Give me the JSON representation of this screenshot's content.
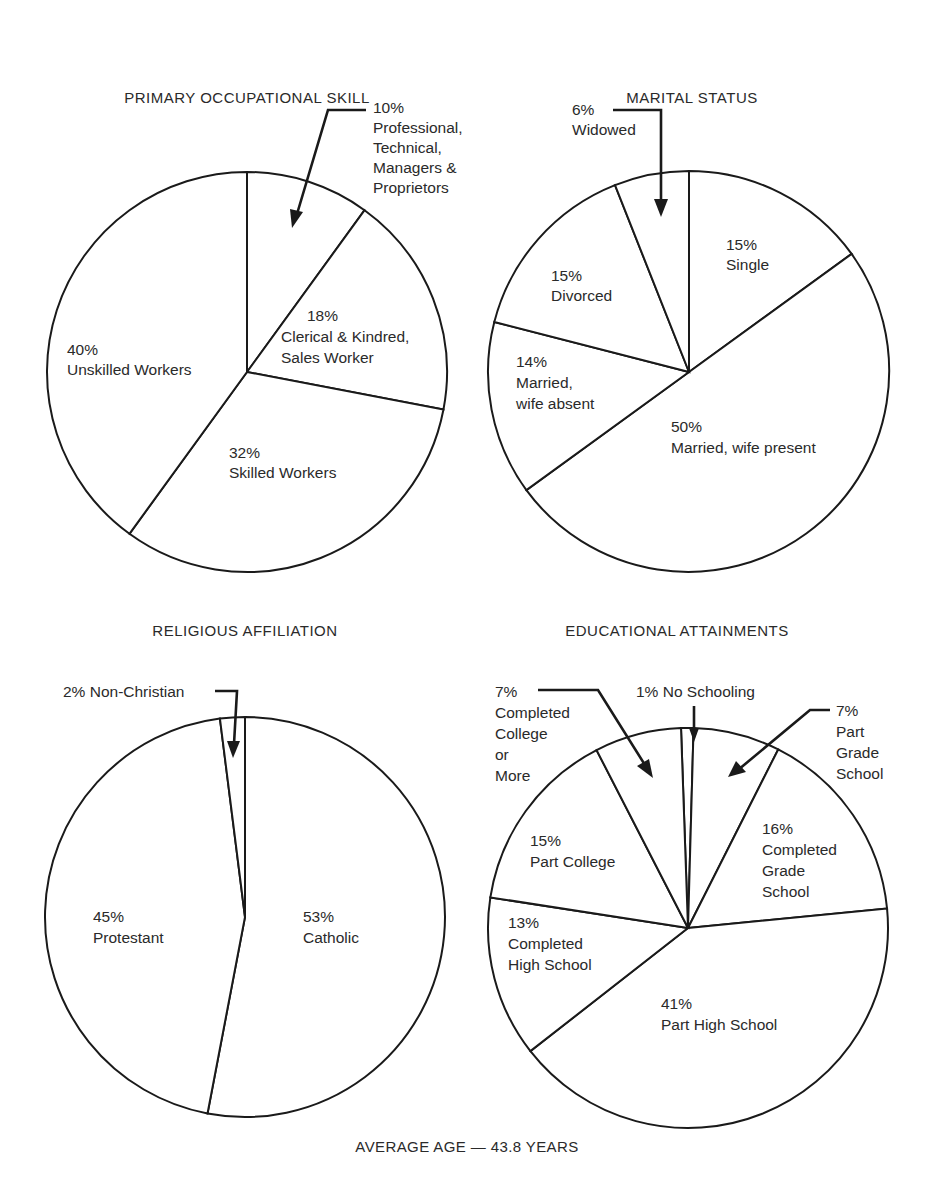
{
  "footer": "AVERAGE AGE — 43.8 YEARS",
  "chart_data": [
    {
      "type": "pie",
      "title": "PRIMARY OCCUPATIONAL SKILL",
      "categories": [
        "Professional, Technical, Managers & Proprietors",
        "Clerical & Kindred, Sales Worker",
        "Skilled Workers",
        "Unskilled Workers"
      ],
      "values": [
        10,
        18,
        32,
        40
      ],
      "unit": "%",
      "start_angle": "12 o'clock",
      "direction": "clockwise"
    },
    {
      "type": "pie",
      "title": "MARITAL STATUS",
      "categories": [
        "Single",
        "Married, wife present",
        "Married, wife absent",
        "Divorced",
        "Widowed"
      ],
      "values": [
        15,
        50,
        14,
        15,
        6
      ],
      "unit": "%",
      "start_angle": "12 o'clock",
      "direction": "clockwise"
    },
    {
      "type": "pie",
      "title": "RELIGIOUS AFFILIATION",
      "categories": [
        "Catholic",
        "Protestant",
        "Non-Christian"
      ],
      "values": [
        53,
        45,
        2
      ],
      "unit": "%",
      "start_angle": "12 o'clock",
      "direction": "clockwise"
    },
    {
      "type": "pie",
      "title": "EDUCATIONAL ATTAINMENTS",
      "categories": [
        "No Schooling",
        "Part Grade School",
        "Completed Grade School",
        "Part High School",
        "Completed High School",
        "Part College",
        "Completed College or More"
      ],
      "values": [
        1,
        7,
        16,
        41,
        13,
        15,
        7
      ],
      "unit": "%",
      "start_angle": "12 o'clock",
      "direction": "clockwise"
    }
  ],
  "charts": {
    "occupation": {
      "title": "PRIMARY OCCUPATIONAL SKILL",
      "labels": {
        "professional": {
          "pct": "10%",
          "line1": "Professional,",
          "line2": "Technical,",
          "line3": "Managers &",
          "line4": "Proprietors"
        },
        "clerical": {
          "pct": "18%",
          "line1": "Clerical & Kindred,",
          "line2": "Sales Worker"
        },
        "skilled": {
          "pct": "32%",
          "line1": "Skilled Workers"
        },
        "unskilled": {
          "pct": "40%",
          "line1": "Unskilled Workers"
        }
      }
    },
    "marital": {
      "title": "MARITAL STATUS",
      "labels": {
        "widowed": {
          "pct": "6%",
          "line1": "Widowed"
        },
        "single": {
          "pct": "15%",
          "line1": "Single"
        },
        "divorced": {
          "pct": "15%",
          "line1": "Divorced"
        },
        "absent": {
          "pct": "14%",
          "line1": "Married,",
          "line2": "wife absent"
        },
        "present": {
          "pct": "50%",
          "line1": "Married, wife present"
        }
      }
    },
    "religion": {
      "title": "RELIGIOUS AFFILIATION",
      "labels": {
        "nonchristian": {
          "text": "2% Non-Christian"
        },
        "protestant": {
          "pct": "45%",
          "line1": "Protestant"
        },
        "catholic": {
          "pct": "53%",
          "line1": "Catholic"
        }
      }
    },
    "education": {
      "title": "EDUCATIONAL ATTAINMENTS",
      "labels": {
        "college": {
          "pct": "7%",
          "line1": "Completed",
          "line2": "College",
          "line3": "or",
          "line4": "More"
        },
        "noschool": {
          "text": "1% No Schooling"
        },
        "partgrade": {
          "pct": "7%",
          "line1": "Part",
          "line2": "Grade",
          "line3": "School"
        },
        "partcollege": {
          "pct": "15%",
          "line1": "Part College"
        },
        "compgrade": {
          "pct": "16%",
          "line1": "Completed",
          "line2": "Grade",
          "line3": "School"
        },
        "comphigh": {
          "pct": "13%",
          "line1": "Completed",
          "line2": "High School"
        },
        "parthigh": {
          "pct": "41%",
          "line1": "Part High School"
        }
      }
    }
  }
}
